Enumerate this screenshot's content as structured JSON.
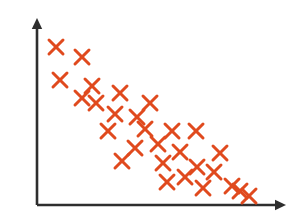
{
  "chart_data": {
    "type": "scatter",
    "title": "",
    "subtitle": "",
    "xlabel": "",
    "ylabel": "",
    "xlim": [
      0,
      100
    ],
    "ylim": [
      0,
      100
    ],
    "grid": false,
    "legend": null,
    "annotations": [],
    "tick_labels": {
      "x": [],
      "y": []
    },
    "relationship": "negative",
    "marker": {
      "shape": "cross",
      "color": "#E04A1E",
      "size_px": 14,
      "stroke_px": 3
    },
    "axes": {
      "color": "#2e2e2e",
      "stroke_px": 2.6,
      "arrowheads": [
        "x-right",
        "y-up"
      ],
      "origin_px": {
        "x": 37,
        "y": 205
      },
      "x_axis_end_px": {
        "x": 286,
        "y": 205
      },
      "y_axis_end_px": {
        "x": 37,
        "y": 18
      }
    },
    "n_points": 28,
    "points_px": [
      {
        "x": 56,
        "y": 47
      },
      {
        "x": 82,
        "y": 57
      },
      {
        "x": 60,
        "y": 80
      },
      {
        "x": 92,
        "y": 86
      },
      {
        "x": 82,
        "y": 98
      },
      {
        "x": 120,
        "y": 93
      },
      {
        "x": 150,
        "y": 103
      },
      {
        "x": 115,
        "y": 114
      },
      {
        "x": 108,
        "y": 131
      },
      {
        "x": 145,
        "y": 129
      },
      {
        "x": 172,
        "y": 131
      },
      {
        "x": 196,
        "y": 131
      },
      {
        "x": 135,
        "y": 148
      },
      {
        "x": 180,
        "y": 152
      },
      {
        "x": 220,
        "y": 153
      },
      {
        "x": 122,
        "y": 161
      },
      {
        "x": 163,
        "y": 163
      },
      {
        "x": 197,
        "y": 167
      },
      {
        "x": 167,
        "y": 182
      },
      {
        "x": 203,
        "y": 188
      },
      {
        "x": 232,
        "y": 186
      },
      {
        "x": 249,
        "y": 196
      },
      {
        "x": 96,
        "y": 103
      },
      {
        "x": 137,
        "y": 117
      },
      {
        "x": 158,
        "y": 144
      },
      {
        "x": 185,
        "y": 177
      },
      {
        "x": 214,
        "y": 172
      },
      {
        "x": 240,
        "y": 191
      }
    ],
    "values": {
      "x": [
        7.6,
        18.1,
        9.2,
        22.1,
        18.1,
        33.3,
        45.4,
        31.3,
        28.5,
        43.4,
        54.2,
        63.9,
        39.4,
        57.4,
        73.5,
        34.1,
        50.6,
        64.3,
        52.2,
        66.7,
        78.3,
        85.1,
        23.7,
        40.2,
        48.6,
        59.4,
        71.1,
        81.5
      ],
      "y": [
        84.6,
        79.2,
        66.8,
        63.6,
        57.2,
        60.9,
        55.5,
        49.1,
        39.9,
        41.0,
        40.0,
        40.0,
        30.8,
        28.6,
        28.0,
        23.6,
        22.5,
        20.3,
        12.2,
        9.0,
        10.1,
        4.7,
        54.6,
        47.0,
        32.5,
        15.0,
        17.7,
        7.4
      ]
    }
  }
}
